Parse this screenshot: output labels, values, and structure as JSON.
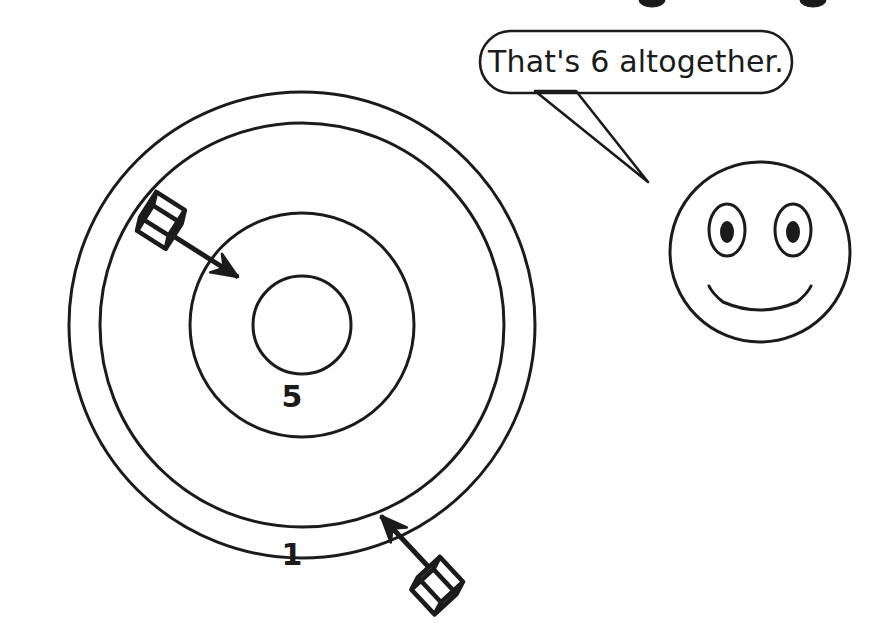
{
  "scene": {
    "title": "Target board with two darts and a smiling face",
    "background_color": "#ffffff",
    "ink_color": "#1b1b1b"
  },
  "target": {
    "name": "scoring-target",
    "center_x": 302,
    "center_y": 325,
    "rings": [
      {
        "label": "1",
        "zone": "outer-ring",
        "radius": 233,
        "fill_color": "#ffffff",
        "label_color": "#1b1b1b",
        "label_x": 292,
        "label_y": 556,
        "label_size": 30
      },
      {
        "label": "3",
        "zone": "grey-ring",
        "radius": 202,
        "fill_color": "#8c8c8c",
        "label_color": "#ffffff",
        "label_x": 295,
        "label_y": 475,
        "label_size": 30
      },
      {
        "label": "5",
        "zone": "inner-white-ring",
        "radius": 112,
        "fill_color": "#ffffff",
        "label_color": "#1b1b1b",
        "label_x": 292,
        "label_y": 398,
        "label_size": 30
      },
      {
        "label": "10",
        "zone": "bullseye",
        "radius": 49,
        "fill_color": "#8c8c8c",
        "label_color": "#ffffff",
        "label_x": 302,
        "label_y": 323,
        "label_size": 30
      }
    ]
  },
  "darts": [
    {
      "name": "dart-in-five-zone",
      "hit_zone_label": "5",
      "tail_x": 145,
      "tail_y": 218,
      "tip_x": 238,
      "tip_y": 277
    },
    {
      "name": "dart-in-three-zone",
      "hit_zone_label": "3",
      "tail_x": 452,
      "tail_y": 592,
      "tip_x": 381,
      "tip_y": 516
    }
  ],
  "speech_bubble": {
    "name": "speech-bubble",
    "text": "That's 6 altogether.",
    "x": 480,
    "y": 31,
    "width": 312,
    "height": 62,
    "corner_radius": 31,
    "tail_tip_x": 648,
    "tail_tip_y": 182
  },
  "face": {
    "name": "smiling-face",
    "center_x": 760,
    "center_y": 252,
    "radius": 90,
    "expression": "smile",
    "eye_left_x": 727,
    "eye_right_x": 793,
    "eye_y": 230,
    "eye_rx": 18,
    "eye_ry": 26,
    "pupil_rx": 7,
    "pupil_ry": 11
  },
  "cropped_marks": {
    "name": "cropped-text-above",
    "items": [
      {
        "x": 652,
        "y": 0,
        "rx": 13,
        "ry": 7
      },
      {
        "x": 813,
        "y": 0,
        "rx": 13,
        "ry": 7
      }
    ]
  },
  "chart_data": {
    "type": "other",
    "rings": [
      "1",
      "3",
      "5",
      "10"
    ],
    "hits": [
      {
        "zone": "5",
        "value": 5
      },
      {
        "zone": "3",
        "value": 3
      }
    ],
    "stated_total": 6
  }
}
